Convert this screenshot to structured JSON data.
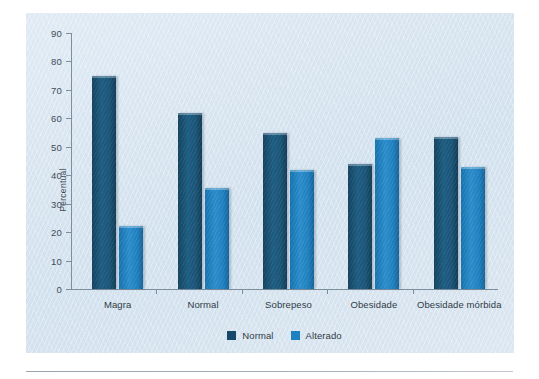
{
  "chart_data": {
    "type": "bar",
    "title": "",
    "xlabel": "",
    "ylabel": "Percentual",
    "ylim": [
      0,
      90
    ],
    "yticks": [
      0,
      10,
      20,
      30,
      40,
      50,
      60,
      70,
      80,
      90
    ],
    "ytick_labels": [
      "0",
      "10",
      "20",
      "30",
      "40",
      "50",
      "60",
      "70",
      "80",
      "90"
    ],
    "grid": false,
    "legend_position": "bottom-center",
    "categories": [
      "Magra",
      "Normal",
      "Sobrepeso",
      "Obesidade",
      "Obesidade mórbida"
    ],
    "series": [
      {
        "name": "Normal",
        "color": "#16486a",
        "values": [
          75,
          62,
          55,
          44,
          53.5
        ]
      },
      {
        "name": "Alterado",
        "color": "#1f80bf",
        "values": [
          22,
          35.5,
          42,
          53,
          43
        ]
      }
    ]
  },
  "legend": {
    "items": [
      {
        "label": "Normal",
        "swatch": "legend-swatch-normal"
      },
      {
        "label": "Alterado",
        "swatch": "legend-swatch-alterado"
      }
    ]
  },
  "colors": {
    "panel_background": "#d8e5f0",
    "series_normal": "#16486a",
    "series_alterado": "#1f80bf",
    "axis": "#7d8e9c",
    "text": "#2f3b45"
  }
}
